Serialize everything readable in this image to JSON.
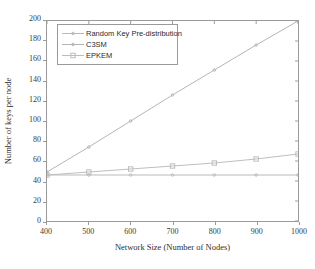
{
  "chart_data": {
    "type": "line",
    "title": "",
    "xlabel": "Network Size (Number of Nodes)",
    "ylabel": "Number of keys per node",
    "xlim": [
      400,
      1000
    ],
    "ylim": [
      0,
      200
    ],
    "xticks": [
      400,
      500,
      600,
      700,
      800,
      900,
      1000
    ],
    "yticks": [
      0,
      20,
      40,
      60,
      80,
      100,
      120,
      140,
      160,
      180,
      200
    ],
    "grid": false,
    "legend_position": "upper-left",
    "x": [
      400,
      500,
      600,
      700,
      800,
      900,
      1000
    ],
    "series": [
      {
        "name": "Random Key Pre-distribution",
        "marker": "dot",
        "color": "#b9b9b9",
        "values": [
          46,
          46,
          46,
          46,
          46,
          46,
          46
        ]
      },
      {
        "name": "C3SM",
        "marker": "dot",
        "color": "#b4b4b4",
        "values": [
          49,
          74,
          100,
          126,
          151,
          176,
          200
        ]
      },
      {
        "name": "EPKEM",
        "marker": "square",
        "color": "#bdbdbd",
        "values": [
          46,
          49,
          52,
          55,
          58,
          62,
          67
        ]
      }
    ]
  },
  "legend": {
    "items": [
      {
        "label": "Random Key Pre-distribution"
      },
      {
        "label": "C3SM"
      },
      {
        "label": "EPKEM"
      }
    ]
  },
  "axes": {
    "x_title": "Network Size (Number of Nodes)",
    "y_title": "Number of keys per node",
    "x_tick_labels": [
      "400",
      "500",
      "600",
      "700",
      "800",
      "900",
      "1000"
    ],
    "y_tick_labels": [
      "0",
      "20",
      "40",
      "60",
      "80",
      "100",
      "120",
      "140",
      "160",
      "180",
      "200"
    ]
  },
  "colors": {
    "axis": "#9a9a9a",
    "background": "#ffffff",
    "series_c3sm": "#b4b4b4",
    "series_epkem": "#bdbdbd",
    "series_rkp": "#b9b9b9"
  }
}
